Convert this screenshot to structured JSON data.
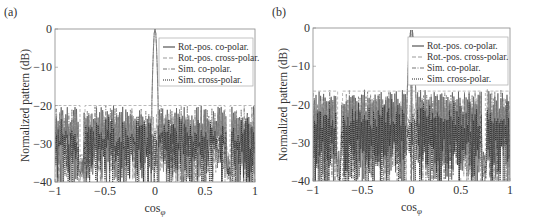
{
  "chart_data": [
    {
      "panel_label": "(a)",
      "type": "line",
      "xlabel": "cosφ",
      "ylabel": "Normalized pattern (dB)",
      "xlim": [
        -1,
        1
      ],
      "ylim": [
        -40,
        0
      ],
      "xticks": [
        -1,
        -0.5,
        0,
        0.5,
        1
      ],
      "xtick_labels": [
        "−1",
        "−0.5",
        "0",
        "0.5",
        "1"
      ],
      "yticks": [
        0,
        -10,
        -20,
        -30,
        -40
      ],
      "ytick_labels": [
        "0",
        "−10",
        "−20",
        "−30",
        "−40"
      ],
      "grid": false,
      "legend_position": "upper right",
      "series": [
        {
          "name": "Rot.-pos. co-polar.",
          "style": "solid",
          "color": "#555555"
        },
        {
          "name": "Rot.-pos. cross-polar.",
          "style": "dashed",
          "color": "#999999"
        },
        {
          "name": "Sim. co-polar.",
          "style": "dashdot",
          "color": "#777777"
        },
        {
          "name": "Sim. cross-polar.",
          "style": "dotted",
          "color": "#222222"
        }
      ],
      "main_lobe": {
        "center": 0,
        "peak_db": 0,
        "halfwidth": 0.03
      },
      "sidelobe_mask_db": -20,
      "mask_segments": [
        [
          -1,
          -0.75
        ],
        [
          -0.7,
          0.7
        ],
        [
          0.75,
          1
        ]
      ],
      "sidelobe_level_range_db": [
        -40,
        -20
      ]
    },
    {
      "panel_label": "(b)",
      "type": "line",
      "xlabel": "cosφ",
      "ylabel": "Normalized pattern (dB)",
      "xlim": [
        -1,
        1
      ],
      "ylim": [
        -40,
        0
      ],
      "xticks": [
        -1,
        -0.5,
        0,
        0.5,
        1
      ],
      "xtick_labels": [
        "−1",
        "−0.5",
        "0",
        "0.5",
        "1"
      ],
      "yticks": [
        0,
        -10,
        -20,
        -30,
        -40
      ],
      "ytick_labels": [
        "0",
        "−10",
        "−20",
        "−30",
        "−40"
      ],
      "grid": false,
      "legend_position": "upper right",
      "series": [
        {
          "name": "Rot.-pos. co-polar.",
          "style": "solid",
          "color": "#555555"
        },
        {
          "name": "Rot.-pos. cross-polar.",
          "style": "dashed",
          "color": "#999999"
        },
        {
          "name": "Sim. co-polar.",
          "style": "dashdot",
          "color": "#777777"
        },
        {
          "name": "Sim. cross-polar.",
          "style": "dotted",
          "color": "#222222"
        }
      ],
      "main_lobe": {
        "center": 0,
        "peak_db": 0,
        "halfwidth": 0.045,
        "split_null": true
      },
      "sidelobe_mask_db": -16.5,
      "mask_segments": [
        [
          -1,
          -0.75
        ],
        [
          -0.7,
          0.7
        ],
        [
          0.75,
          1
        ]
      ],
      "sidelobe_level_range_db": [
        -40,
        -16
      ]
    }
  ]
}
